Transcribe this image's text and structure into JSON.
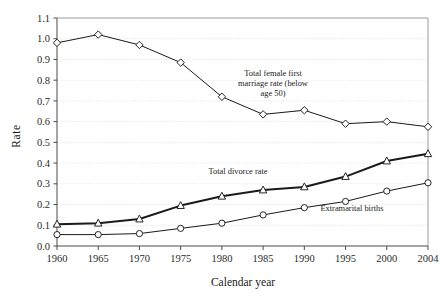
{
  "chart_data": {
    "type": "line",
    "title": "",
    "xlabel": "Calendar year",
    "ylabel": "Rate",
    "grid": true,
    "legend_position": "inline-annotations",
    "categories": [
      "1960",
      "1965",
      "1970",
      "1975",
      "1980",
      "1985",
      "1990",
      "1995",
      "2000",
      "2004"
    ],
    "x": [
      1960,
      1965,
      1970,
      1975,
      1980,
      1985,
      1990,
      1995,
      2000,
      2004
    ],
    "xlim": [
      1960,
      2004
    ],
    "ylim": [
      0.0,
      1.1
    ],
    "ytick_labels": [
      "0.0",
      "0.1",
      "0.2",
      "0.3",
      "0.4",
      "0.5",
      "0.6",
      "0.7",
      "0.8",
      "0.9",
      "1.0",
      "1.1"
    ],
    "ytick_values": [
      0.0,
      0.1,
      0.2,
      0.3,
      0.4,
      0.5,
      0.6,
      0.7,
      0.8,
      0.9,
      1.0,
      1.1
    ],
    "series": [
      {
        "name": "Total female first marriage rate (below age 50)",
        "marker": "diamond",
        "color": "#1a1a1a",
        "line_width": 1.0,
        "values": [
          0.98,
          1.02,
          0.97,
          0.885,
          0.72,
          0.635,
          0.655,
          0.59,
          0.6,
          0.575
        ]
      },
      {
        "name": "Total divorce rate",
        "marker": "triangle",
        "color": "#1a1a1a",
        "line_width": 2.0,
        "values": [
          0.105,
          0.11,
          0.13,
          0.195,
          0.24,
          0.27,
          0.285,
          0.335,
          0.41,
          0.445
        ]
      },
      {
        "name": "Extramarital births",
        "marker": "circle",
        "color": "#1a1a1a",
        "line_width": 1.0,
        "values": [
          0.055,
          0.055,
          0.06,
          0.085,
          0.11,
          0.15,
          0.185,
          0.215,
          0.265,
          0.305
        ]
      }
    ],
    "annotations": [
      {
        "id": "marriage",
        "lines": [
          "Total female first",
          "marriage rate (below",
          "age 50)"
        ],
        "x": 273,
        "y": 76
      },
      {
        "id": "divorce",
        "lines": [
          "Total divorce rate"
        ],
        "x": 238,
        "y": 174
      },
      {
        "id": "births",
        "lines": [
          "Extramarital births"
        ],
        "x": 352,
        "y": 211
      }
    ]
  },
  "axis_labels": {
    "y_title": "Rate",
    "x_title": "Calendar year"
  },
  "colors": {
    "grid": "#d9d9d9",
    "axis": "#4a4a4a",
    "ink": "#1a1a1a",
    "background": "#ffffff"
  }
}
